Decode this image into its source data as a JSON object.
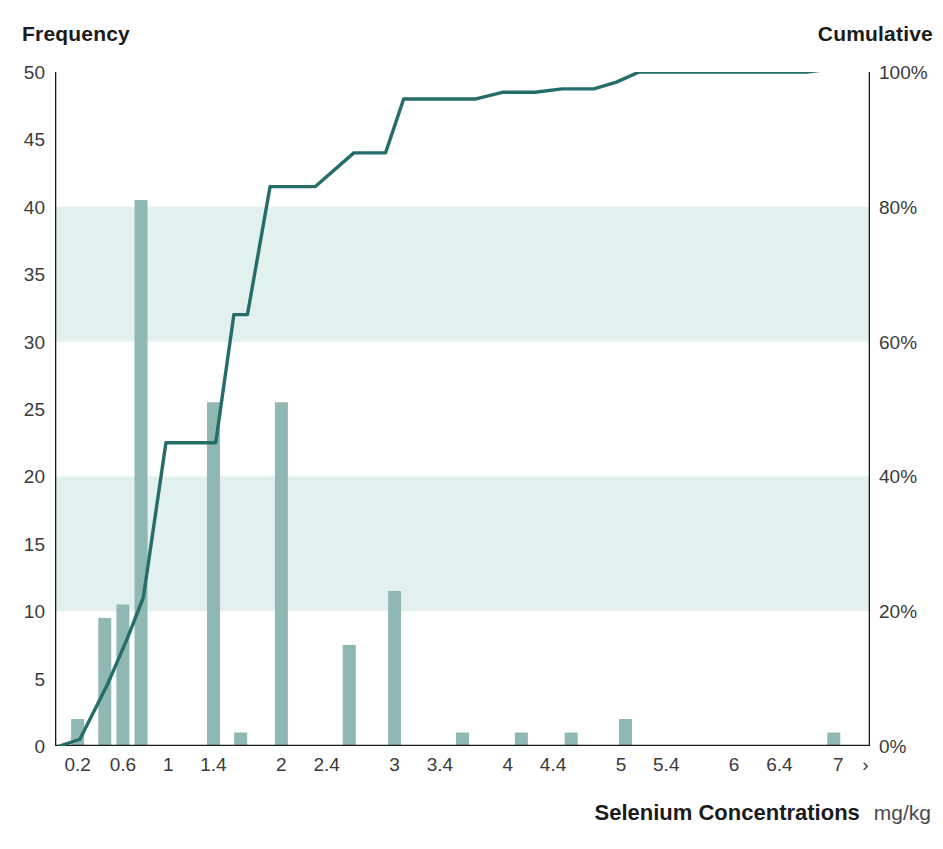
{
  "header": {
    "left_label": "Frequency",
    "right_label": "Cumulative"
  },
  "axis_title": {
    "text": "Selenium Concentrations",
    "unit": "mg/kg"
  },
  "colors": {
    "bar": "#8fb8b2",
    "line": "#256d69",
    "band": "#e2f1ee",
    "axis": "#1b1b1b",
    "tick_text": "#3b3b3b"
  },
  "chart_data": {
    "type": "bar",
    "title": "",
    "subtitle": "",
    "xlabel": "Selenium Concentrations  mg/kg",
    "ylabel": "Frequency",
    "y2label": "Cumulative",
    "grid": false,
    "legend_position": "none",
    "ylim": [
      0,
      50
    ],
    "yticks": [
      0,
      5,
      10,
      15,
      20,
      25,
      30,
      35,
      40,
      45,
      50
    ],
    "ytick_labels": [
      "0",
      "5",
      "10",
      "15",
      "20",
      "25",
      "30",
      "35",
      "40",
      "45",
      "50"
    ],
    "y2lim": [
      0,
      100
    ],
    "y2ticks": [
      0,
      20,
      40,
      60,
      80,
      100
    ],
    "y2tick_labels": [
      "0%",
      "20%",
      "40%",
      "60%",
      "80%",
      "100%"
    ],
    "xlim": [
      0,
      18
    ],
    "xtick_labels": [
      "0.2",
      "0.6",
      "1",
      "1.4",
      "2",
      "2.4",
      "3",
      "3.4",
      "4",
      "4.4",
      "5",
      "5.4",
      "6",
      "6.4",
      "7",
      "›"
    ],
    "xtick_positions": [
      0.5,
      1.5,
      2.5,
      3.5,
      5.0,
      6.0,
      7.5,
      8.5,
      10.0,
      11.0,
      12.5,
      13.5,
      15.0,
      16.0,
      17.3,
      17.9
    ],
    "bin_centers": [
      0.2,
      0.6,
      1.0,
      1.4,
      2.0,
      2.4,
      3.0,
      3.4,
      4.0,
      4.4,
      5.0,
      5.4,
      6.0,
      6.4,
      7.0
    ],
    "shaded_bands": [
      {
        "from": 10,
        "to": 20
      },
      {
        "from": 30,
        "to": 40
      }
    ],
    "series": [
      {
        "name": "Frequency",
        "type": "bar",
        "axis": "left",
        "color": "#8fb8b2",
        "x": [
          0.5,
          1.1,
          1.5,
          1.9,
          2.5,
          3.5,
          4.1,
          5.0,
          5.6,
          6.5,
          7.5,
          9.0,
          10.3,
          11.4,
          12.6,
          17.2
        ],
        "values": [
          2,
          9.5,
          10.5,
          40.5,
          0,
          25.5,
          1,
          25.5,
          0,
          7.5,
          11.5,
          1,
          1,
          1,
          2,
          1
        ]
      },
      {
        "name": "Cumulative",
        "type": "line",
        "axis": "right",
        "color": "#256d69",
        "points": [
          {
            "x": 0.1,
            "y": 0
          },
          {
            "x": 0.55,
            "y": 1
          },
          {
            "x": 1.15,
            "y": 9
          },
          {
            "x": 1.6,
            "y": 16
          },
          {
            "x": 1.95,
            "y": 22
          },
          {
            "x": 2.45,
            "y": 45
          },
          {
            "x": 3.55,
            "y": 45
          },
          {
            "x": 3.95,
            "y": 64
          },
          {
            "x": 4.25,
            "y": 64
          },
          {
            "x": 4.75,
            "y": 83
          },
          {
            "x": 5.75,
            "y": 83
          },
          {
            "x": 6.6,
            "y": 88
          },
          {
            "x": 7.3,
            "y": 88
          },
          {
            "x": 7.7,
            "y": 96
          },
          {
            "x": 9.3,
            "y": 96
          },
          {
            "x": 9.9,
            "y": 97
          },
          {
            "x": 10.6,
            "y": 97
          },
          {
            "x": 11.2,
            "y": 97.5
          },
          {
            "x": 11.9,
            "y": 97.5
          },
          {
            "x": 12.4,
            "y": 98.5
          },
          {
            "x": 12.9,
            "y": 100
          },
          {
            "x": 16.6,
            "y": 100
          },
          {
            "x": 17.2,
            "y": 100.5
          },
          {
            "x": 18.0,
            "y": 100.5
          }
        ]
      }
    ]
  }
}
